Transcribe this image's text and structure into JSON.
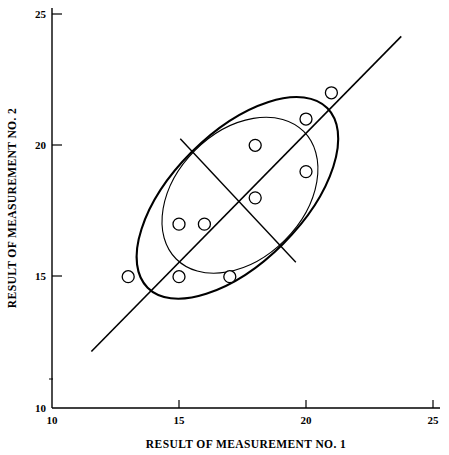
{
  "chart_data": {
    "type": "scatter",
    "title": "",
    "xlabel": "RESULT OF MEASUREMENT NO. 1",
    "ylabel": "RESULT OF MEASUREMENT NO. 2",
    "xlim": [
      10,
      25
    ],
    "ylim": [
      10,
      25
    ],
    "xticks": [
      10,
      15,
      20,
      25
    ],
    "yticks": [
      10,
      15,
      20,
      25
    ],
    "xtick_labels": [
      "10",
      "15",
      "20",
      "25"
    ],
    "ytick_labels": [
      "10",
      "15",
      "20",
      "25"
    ],
    "grid": false,
    "legend": "none",
    "marker": "open-circle",
    "points": [
      {
        "x": 13,
        "y": 15
      },
      {
        "x": 15,
        "y": 15
      },
      {
        "x": 17,
        "y": 15
      },
      {
        "x": 15,
        "y": 17
      },
      {
        "x": 16,
        "y": 17
      },
      {
        "x": 18,
        "y": 18
      },
      {
        "x": 18,
        "y": 20
      },
      {
        "x": 20,
        "y": 19
      },
      {
        "x": 20,
        "y": 21
      },
      {
        "x": 21,
        "y": 22
      }
    ],
    "annotations": [
      {
        "name": "outer-confidence-ellipse",
        "type": "ellipse",
        "center": {
          "x": 17.3,
          "y": 18.0
        },
        "semi_major": 5.0,
        "semi_minor": 2.55,
        "angle_deg": 45
      },
      {
        "name": "inner-confidence-ellipse",
        "type": "ellipse",
        "center": {
          "x": 17.4,
          "y": 18.1
        },
        "semi_major": 3.55,
        "semi_minor": 2.5,
        "angle_deg": 45
      },
      {
        "name": "identity-line",
        "type": "line",
        "from": {
          "x": 11.55,
          "y": 12.15
        },
        "to": {
          "x": 23.75,
          "y": 24.15
        }
      },
      {
        "name": "minor-axis-line",
        "type": "line",
        "from": {
          "x": 15.05,
          "y": 20.25
        },
        "to": {
          "x": 19.6,
          "y": 15.55
        }
      }
    ]
  },
  "axes": {
    "x": {
      "title": "RESULT OF MEASUREMENT NO. 1",
      "ticks": [
        {
          "value": 10,
          "label": "10",
          "px": 52
        },
        {
          "value": 15,
          "label": "15",
          "px": 179
        },
        {
          "value": 20,
          "label": "20",
          "px": 306
        },
        {
          "value": 25,
          "label": "25",
          "px": 433
        }
      ]
    },
    "y": {
      "title": "RESULT OF MEASUREMENT NO. 2",
      "ticks": [
        {
          "value": 25,
          "label": "25",
          "px": 14
        },
        {
          "value": 20,
          "label": "20",
          "px": 145
        },
        {
          "value": 15,
          "label": "15",
          "px": 276
        },
        {
          "value": 10,
          "label": "10",
          "px": 408
        }
      ]
    }
  }
}
